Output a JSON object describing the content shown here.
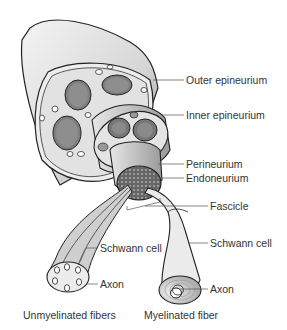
{
  "diagram": {
    "labels": {
      "outer_epineurium": "Outer epineurium",
      "inner_epineurium": "Inner epineurium",
      "perineurium": "Perineurium",
      "endoneurium": "Endoneurium",
      "fascicle": "Fascicle",
      "schwann_cell_myelinated": "Schwann cell",
      "schwann_cell_unmyelinated": "Schwann cell",
      "axon_unmyelinated": "Axon",
      "axon_myelinated": "Axon"
    },
    "captions": {
      "unmyelinated": "Unmyelinated fibers",
      "myelinated": "Myelinated fiber"
    },
    "colors": {
      "outline": "#222222",
      "fill_light": "#e8e8e8",
      "fill_mid": "#bdbdbd",
      "fill_dark": "#8a8a8a",
      "leader_line": "#555555"
    }
  }
}
